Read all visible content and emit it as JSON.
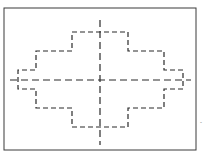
{
  "diagram": {
    "type": "stepped-profile-with-centerlines",
    "frame": {
      "x": 4,
      "y": 8,
      "width": 192,
      "height": 142,
      "stroke": "#3a3a3a"
    },
    "profile": {
      "stroke": "#2a2a2a",
      "dash": "5,3",
      "points": "72,32 128,32 128,51 164,51 164,70 183,70 183,89 164,89 164,108 128,108 128,127 72,127 72,108 36,108 36,89 18,89 18,70 36,70 36,51 72,51"
    },
    "centerlines": {
      "stroke": "#2a2a2a",
      "dash": "7,4",
      "horizontal": {
        "x1": 10,
        "y1": 80,
        "x2": 191,
        "y2": 80
      },
      "vertical": {
        "x1": 100,
        "y1": 20,
        "x2": 100,
        "y2": 145
      }
    },
    "marks": [
      {
        "x": 200,
        "y": 124,
        "text": "-"
      }
    ]
  }
}
